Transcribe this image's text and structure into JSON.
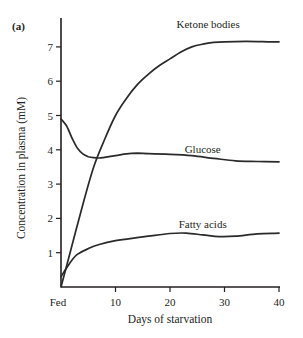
{
  "panel_label": "(a)",
  "colors": {
    "line": "#2a2a2a",
    "axis": "#231f20",
    "text": "#231f20",
    "background": "#ffffff"
  },
  "chart_data": {
    "type": "line",
    "title": "",
    "panel_label": "(a)",
    "xlabel": "Days of starvation",
    "ylabel": "Concentration in plasma (mM)",
    "x_ticks": [
      {
        "value": 0,
        "label": "Fed"
      },
      {
        "value": 10,
        "label": "10"
      },
      {
        "value": 20,
        "label": "20"
      },
      {
        "value": 30,
        "label": "30"
      },
      {
        "value": 40,
        "label": "40"
      }
    ],
    "y_ticks": [
      1,
      2,
      3,
      4,
      5,
      6,
      7
    ],
    "xlim": [
      0,
      40.5
    ],
    "ylim": [
      0,
      7.7
    ],
    "grid": false,
    "legend": "inline labels",
    "series": [
      {
        "name": "Ketone bodies",
        "label_pos": {
          "x": 27,
          "y": 7.55
        },
        "points": [
          [
            0,
            0
          ],
          [
            2,
            1.2
          ],
          [
            4,
            2.4
          ],
          [
            6,
            3.5
          ],
          [
            8,
            4.3
          ],
          [
            10,
            5.0
          ],
          [
            12,
            5.5
          ],
          [
            14,
            5.9
          ],
          [
            16,
            6.2
          ],
          [
            18,
            6.45
          ],
          [
            20,
            6.65
          ],
          [
            22,
            6.85
          ],
          [
            24,
            7.0
          ],
          [
            26,
            7.08
          ],
          [
            28,
            7.13
          ],
          [
            30,
            7.15
          ],
          [
            34,
            7.16
          ],
          [
            38,
            7.15
          ],
          [
            40,
            7.15
          ]
        ]
      },
      {
        "name": "Glucose",
        "label_pos": {
          "x": 26,
          "y": 3.9
        },
        "points": [
          [
            0,
            4.9
          ],
          [
            1,
            4.7
          ],
          [
            2,
            4.35
          ],
          [
            3,
            4.05
          ],
          [
            4,
            3.88
          ],
          [
            5,
            3.8
          ],
          [
            6,
            3.77
          ],
          [
            7,
            3.76
          ],
          [
            8,
            3.78
          ],
          [
            10,
            3.83
          ],
          [
            12,
            3.88
          ],
          [
            14,
            3.9
          ],
          [
            16,
            3.89
          ],
          [
            20,
            3.87
          ],
          [
            24,
            3.83
          ],
          [
            28,
            3.75
          ],
          [
            32,
            3.68
          ],
          [
            36,
            3.66
          ],
          [
            40,
            3.65
          ]
        ]
      },
      {
        "name": "Fatty acids",
        "label_pos": {
          "x": 26,
          "y": 1.72
        },
        "points": [
          [
            0,
            0.3
          ],
          [
            1,
            0.55
          ],
          [
            2,
            0.78
          ],
          [
            3,
            0.95
          ],
          [
            5,
            1.12
          ],
          [
            7,
            1.24
          ],
          [
            10,
            1.35
          ],
          [
            13,
            1.42
          ],
          [
            16,
            1.48
          ],
          [
            20,
            1.56
          ],
          [
            23,
            1.57
          ],
          [
            26,
            1.52
          ],
          [
            29,
            1.47
          ],
          [
            32,
            1.48
          ],
          [
            36,
            1.55
          ],
          [
            40,
            1.57
          ]
        ]
      }
    ]
  }
}
